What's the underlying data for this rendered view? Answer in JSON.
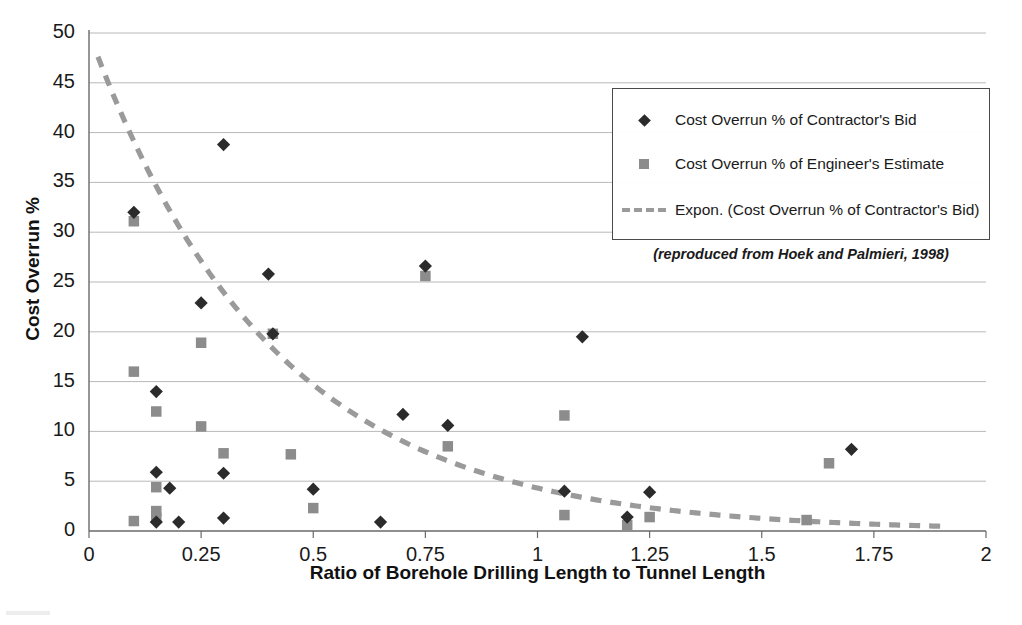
{
  "chart_data": {
    "type": "scatter",
    "title": "",
    "xlabel": "Ratio of Borehole Drilling Length to Tunnel Length",
    "ylabel": "Cost Overrun %",
    "xlim": [
      0,
      2
    ],
    "ylim": [
      0,
      50
    ],
    "xticks": [
      "0",
      "0.25",
      "0.5",
      "0.75",
      "1",
      "1.25",
      "1.5",
      "1.75",
      "2"
    ],
    "xtick_values": [
      0,
      0.25,
      0.5,
      0.75,
      1,
      1.25,
      1.5,
      1.75,
      2
    ],
    "yticks": [
      "0",
      "5",
      "10",
      "15",
      "20",
      "25",
      "30",
      "35",
      "40",
      "45",
      "50"
    ],
    "ytick_values": [
      0,
      5,
      10,
      15,
      20,
      25,
      30,
      35,
      40,
      45,
      50
    ],
    "grid": "horizontal",
    "legend_position": "upper-right",
    "series": [
      {
        "name": "Cost Overrun % of Contractor's Bid",
        "marker": "diamond",
        "color": "#2b2b2b",
        "points": [
          [
            0.1,
            32.0
          ],
          [
            0.15,
            14.0
          ],
          [
            0.15,
            5.9
          ],
          [
            0.15,
            0.9
          ],
          [
            0.18,
            4.3
          ],
          [
            0.2,
            0.9
          ],
          [
            0.25,
            22.9
          ],
          [
            0.3,
            38.8
          ],
          [
            0.3,
            5.8
          ],
          [
            0.3,
            1.3
          ],
          [
            0.4,
            25.8
          ],
          [
            0.41,
            19.8
          ],
          [
            0.5,
            4.2
          ],
          [
            0.65,
            0.9
          ],
          [
            0.7,
            11.7
          ],
          [
            0.75,
            26.6
          ],
          [
            0.8,
            10.6
          ],
          [
            1.06,
            4.0
          ],
          [
            1.1,
            19.5
          ],
          [
            1.2,
            1.4
          ],
          [
            1.25,
            3.9
          ],
          [
            1.7,
            8.2
          ]
        ]
      },
      {
        "name": "Cost Overrun % of Engineer's Estimate",
        "marker": "square",
        "color": "#8c8c8c",
        "points": [
          [
            0.1,
            31.1
          ],
          [
            0.1,
            16.0
          ],
          [
            0.1,
            1.0
          ],
          [
            0.15,
            12.0
          ],
          [
            0.15,
            4.4
          ],
          [
            0.15,
            2.0
          ],
          [
            0.15,
            1.3
          ],
          [
            0.25,
            18.9
          ],
          [
            0.25,
            10.5
          ],
          [
            0.3,
            7.8
          ],
          [
            0.41,
            19.8
          ],
          [
            0.45,
            7.7
          ],
          [
            0.5,
            2.3
          ],
          [
            0.75,
            25.6
          ],
          [
            0.8,
            8.5
          ],
          [
            1.06,
            11.6
          ],
          [
            1.06,
            1.6
          ],
          [
            1.2,
            0.6
          ],
          [
            1.25,
            1.4
          ],
          [
            1.6,
            1.1
          ],
          [
            1.65,
            6.8
          ]
        ]
      }
    ],
    "trendline": {
      "name": "Expon. (Cost Overrun % of Contractor's Bid)",
      "type": "exponential",
      "style": "dashed",
      "color": "#9a9a9a",
      "amplitude": 50.0,
      "decay": 2.45,
      "x_start": 0.02,
      "x_end": 1.9
    },
    "annotations": [
      "(reproduced from Hoek and Palmieri, 1998)"
    ]
  },
  "legend": {
    "items": [
      {
        "label": "Cost Overrun % of Contractor's Bid",
        "key": "diamond-marker"
      },
      {
        "label": "Cost Overrun % of Engineer's Estimate",
        "key": "square-marker"
      },
      {
        "label": "Expon. (Cost Overrun % of Contractor's Bid)",
        "key": "dashed-line"
      }
    ]
  },
  "credit": "(reproduced from Hoek and Palmieri, 1998)"
}
